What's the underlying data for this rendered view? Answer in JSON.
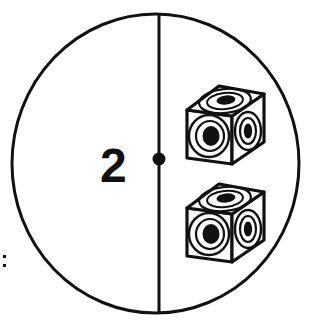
{
  "figure": {
    "kind": "dice-diagram",
    "background_color": "#ffffff",
    "ink_color": "#111111"
  },
  "circle": {
    "name": "boundary-circle",
    "center_x": 155.5,
    "center_y": 163.5,
    "radius_x": 143.5,
    "radius_y": 149.5,
    "stroke_width": 3
  },
  "divider": {
    "name": "vertical-diameter",
    "x": 159,
    "y_top": 14,
    "y_bottom": 313,
    "stroke_width": 3
  },
  "center_dot": {
    "name": "center-dot",
    "cx": 159,
    "cy": 159,
    "r": 6.5
  },
  "left_half": {
    "label": "2",
    "label_x": 100,
    "label_y": 182
  },
  "margin_mark": {
    "label": ":",
    "dots": [
      {
        "x": 3,
        "y": 255,
        "size": 3
      },
      {
        "x": 3,
        "y": 264,
        "size": 3
      }
    ]
  },
  "right_half": {
    "dice_count": 2,
    "dice": [
      {
        "name": "die-upper",
        "origin_x": 184,
        "origin_y": 70,
        "pips_top": 1,
        "pips_front": 1,
        "pips_right": 1,
        "total_shown": 3
      },
      {
        "name": "die-lower",
        "origin_x": 184,
        "origin_y": 168,
        "pips_top": 1,
        "pips_front": 1,
        "pips_right": 1,
        "total_shown": 3
      }
    ]
  },
  "colors": {
    "ink": "#111111",
    "paper": "#ffffff"
  }
}
